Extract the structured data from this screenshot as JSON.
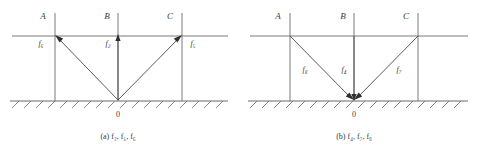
{
  "figure": {
    "panels": [
      {
        "id": "a",
        "caption_prefix": "(a)",
        "caption_forces": "f₂, f₅, f₆",
        "caption_full": "(a) f₂, f₅, f₆",
        "origin_label": "0",
        "vertical_lines": [
          {
            "name": "A",
            "label": "A"
          },
          {
            "name": "B",
            "label": "B"
          },
          {
            "name": "C",
            "label": "C"
          }
        ],
        "forces": [
          {
            "name": "f6",
            "label": "f₆",
            "at": "A",
            "direction": "up-left-away-from-origin"
          },
          {
            "name": "f2",
            "label": "f₂",
            "at": "B",
            "direction": "up-away-from-origin"
          },
          {
            "name": "f5",
            "label": "f₅",
            "at": "C",
            "direction": "up-right-away-from-origin"
          }
        ]
      },
      {
        "id": "b",
        "caption_prefix": "(b)",
        "caption_forces": "f₄, f₇, f₈",
        "caption_full": "(b) f₄, f₇, f₈",
        "origin_label": "0",
        "vertical_lines": [
          {
            "name": "A",
            "label": "A"
          },
          {
            "name": "B",
            "label": "B"
          },
          {
            "name": "C",
            "label": "C"
          }
        ],
        "forces": [
          {
            "name": "f8",
            "label": "f₈",
            "at": "A",
            "direction": "down-right-toward-origin"
          },
          {
            "name": "f4",
            "label": "f₄",
            "at": "B",
            "direction": "down-toward-origin"
          },
          {
            "name": "f7",
            "label": "f₇",
            "at": "C",
            "direction": "down-left-toward-origin"
          }
        ]
      }
    ],
    "colors": {
      "line": "#6b6b6b",
      "stroke_dark": "#4a4a4a",
      "text": "#3a3a3a",
      "background": "#ffffff"
    }
  }
}
